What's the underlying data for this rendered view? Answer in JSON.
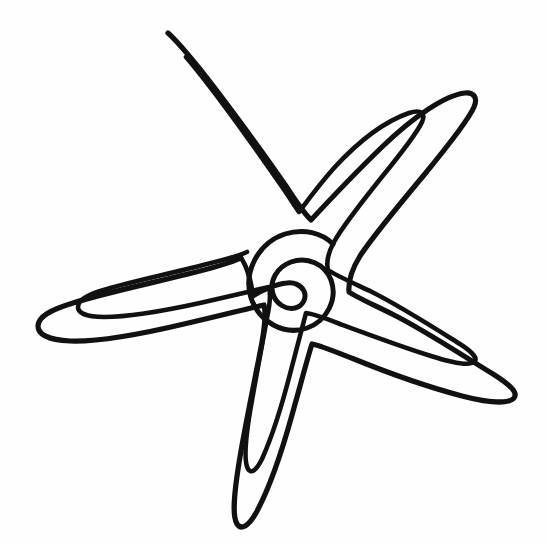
{
  "artwork": {
    "title": "Starfish",
    "subject": "starfish",
    "style": "single-line outline drawing",
    "medium": "black ink line art on white background",
    "background_color": "#fefefe",
    "line_color": "#111111",
    "stroke_width_px": 5,
    "canvas": {
      "width": 547,
      "height": 543
    },
    "text_present": "none",
    "shape_summary": {
      "arm_count": 5,
      "center_feature": "spiral",
      "contours": "double parallel outline (outer silhouette plus inset inner line)",
      "open_endpoints": 3
    },
    "arm_tips": [
      {
        "name": "upper-arm-tip",
        "x": 168,
        "y": 33
      },
      {
        "name": "upper-right-arm-tip",
        "x": 465,
        "y": 93
      },
      {
        "name": "lower-right-arm-tip",
        "x": 513,
        "y": 389
      },
      {
        "name": "lower-arm-tip",
        "x": 244,
        "y": 527
      },
      {
        "name": "left-arm-tip",
        "x": 38,
        "y": 303
      }
    ],
    "spiral": {
      "center_x": 295,
      "center_y": 281,
      "outer_radius": 42,
      "turns": 2.2
    },
    "paths": {
      "outer_contour": "M 168 33 C 176 40 196 63 214 87 C 236 116 264 154 286 186 C 295 200 303 212 311 220 C 324 206 352 176 382 147 C 412 118 445 95 465 93 C 474 92 478 98 474 107 C 468 121 447 147 424 175 C 399 205 373 236 360 256 C 352 269 348 281 349 292 C 356 297 372 304 394 315 C 424 330 465 357 493 374 C 512 386 518 393 514 398 C 509 404 489 403 462 396 C 428 387 386 372 354 359 C 336 352 322 346 312 344 C 308 356 301 383 292 415 C 282 451 268 491 256 513 C 248 527 241 530 237 524 C 232 516 234 494 239 463 C 245 425 256 375 262 342 C 265 325 266 313 264 305 C 250 308 219 316 184 324 C 146 333 98 342 70 341 C 48 340 38 334 38 326 C 38 317 50 310 73 303 C 105 293 152 283 188 274 C 213 268 230 263 241 258",
      "inner_contour": "M 186 57 C 192 64 208 84 223 104 C 241 128 262 158 278 181 C 288 195 294 205 299 212 C 305 204 318 186 334 168 C 356 144 383 122 409 113 C 421 109 426 113 422 122 C 416 135 399 156 381 178 C 361 203 342 227 334 242 C 328 253 326 262 328 270 C 335 275 351 282 372 292 C 400 306 436 329 460 344 C 474 353 478 359 474 362 C 469 366 453 363 431 356 C 402 347 367 334 340 324 C 325 318 314 314 306 313 C 303 324 297 347 290 374 C 282 405 271 439 262 459 C 256 471 251 474 248 469 C 244 462 245 444 249 418 C 254 387 262 346 267 318 C 270 304 271 294 269 287 C 256 290 230 296 200 303 C 168 310 128 317 104 317 C 86 317 78 313 78 307 C 78 300 88 294 107 289 C 134 281 173 273 203 265 C 224 260 238 256 247 252",
      "spiral_path": "M 253 296 C 262 290 276 284 287 283 C 294 282 301 285 304 291 C 307 298 303 306 295 308 C 286 310 276 304 273 294 C 269 281 277 267 291 262 C 307 256 325 264 331 280 C 338 299 327 321 307 328 C 284 336 259 322 251 298 C 243 272 258 243 285 234 C 304 228 322 233 333 244",
      "tail_stroke": "M 241 258 C 246 265 251 280 253 296"
    }
  }
}
